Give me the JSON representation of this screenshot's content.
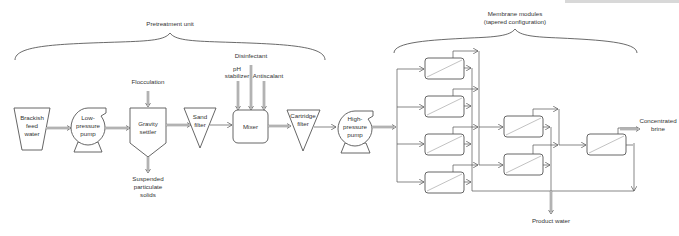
{
  "sections": {
    "pretreatment": "Pretreatment unit",
    "membrane_line1": "Membrane modules",
    "membrane_line2": "(tapered configuration)"
  },
  "units": {
    "feed": [
      "Brackish",
      "feed",
      "water"
    ],
    "lp_pump": [
      "Low-",
      "pressure",
      "pump"
    ],
    "settler": [
      "Gravity",
      "settler"
    ],
    "sand_filter": [
      "Sand",
      "filter"
    ],
    "mixer": "Mixer",
    "cartridge_filter": [
      "Cartridge",
      "filter"
    ],
    "hp_pump": [
      "High-",
      "pressure",
      "pump"
    ]
  },
  "inputs": {
    "flocculation": "Flocculation",
    "disinfectant": "Disinfectant",
    "ph_line1": "pH",
    "ph_line2": "stabilizer",
    "antiscalant": "Antiscalant"
  },
  "outputs": {
    "solids": [
      "Suspended",
      "particulate",
      "solids"
    ],
    "brine": [
      "Concentrated",
      "brine"
    ],
    "product": "Product water"
  },
  "stages": {
    "stage1_modules": 4,
    "stage2_modules": 2,
    "stage3_modules": 1
  },
  "colors": {
    "stroke": "#555555",
    "text": "#333333",
    "background": "#ffffff"
  }
}
